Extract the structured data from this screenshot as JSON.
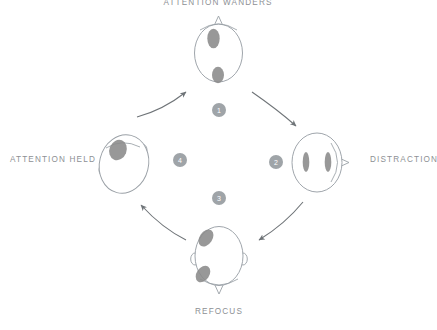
{
  "diagram": {
    "title_cycle": "attention cycle",
    "colors": {
      "outline": "#9aa0a6",
      "blob": "#8a8a8a",
      "arrow": "#6f7478",
      "badge_fill": "#9fa4a8",
      "badge_text": "#ffffff",
      "label_text": "#8d9094",
      "background": "#ffffff"
    },
    "stages": [
      {
        "id": "attention-wanders",
        "label": "ATTENTION WANDERS",
        "position": "top",
        "step": "1",
        "blobs": 2,
        "blob_description": "one blob upper-left of center, one blob lower center"
      },
      {
        "id": "distraction",
        "label": "DISTRACTION",
        "position": "right",
        "step": "2",
        "blobs": 2,
        "blob_description": "two symmetric vertical blobs, head rotated nose-right"
      },
      {
        "id": "refocus",
        "label": "REFOCUS",
        "position": "bottom",
        "step": "3",
        "blobs": 2,
        "blob_description": "two tilted blobs along the left side"
      },
      {
        "id": "attention-held",
        "label": "ATTENTION HELD",
        "position": "left",
        "step": "4",
        "blobs": 1,
        "blob_description": "single large blob upper-left"
      }
    ],
    "arrows": [
      {
        "id": "arrow-held-to-wanders",
        "from": "attention-held",
        "to": "attention-wanders"
      },
      {
        "id": "arrow-wanders-to-distraction",
        "from": "attention-wanders",
        "to": "distraction"
      },
      {
        "id": "arrow-distraction-to-refocus",
        "from": "distraction",
        "to": "refocus"
      },
      {
        "id": "arrow-refocus-to-held",
        "from": "refocus",
        "to": "attention-held"
      }
    ]
  }
}
